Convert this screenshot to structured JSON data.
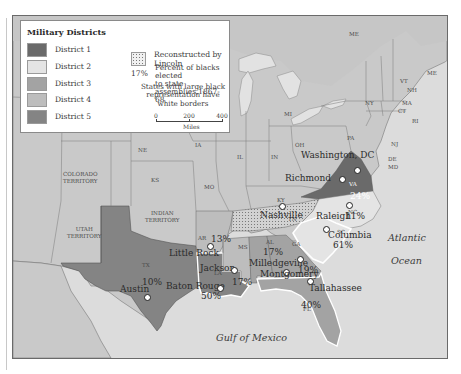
{
  "legend": {
    "title": "Military Districts",
    "districts": [
      {
        "label": "District 1",
        "color": "#6a6a6a"
      },
      {
        "label": "District 2",
        "color": "#e4e4e4"
      },
      {
        "label": "District 3",
        "color": "#a3a3a3"
      },
      {
        "label": "District 4",
        "color": "#bdbdbd"
      },
      {
        "label": "District 5",
        "color": "#848484"
      }
    ],
    "lincoln_label": "Reconstructed by Lincoln",
    "pct_sample": "17%",
    "pct_desc_1": "Percent of blacks elected",
    "pct_desc_2": "to state assemblies,1867-68",
    "white_border_note_1": "States with large black",
    "white_border_note_2": "representation have white borders",
    "scale": {
      "ticks": [
        "0",
        "200",
        "400"
      ],
      "unit": "Miles"
    }
  },
  "colors": {
    "land": "#c9c9c9",
    "water": "#dcdcdc",
    "lakes": "#e2e2e2",
    "tennessee_dotted": "#d2d2d2"
  },
  "states": {
    "ME": "ME",
    "VT": "VT",
    "NH": "NH",
    "MA": "MA",
    "CT": "CT",
    "RI": "RI",
    "NY": "NY",
    "NJ": "NJ",
    "PA": "PA",
    "DE": "DE",
    "MD": "MD",
    "OH": "OH",
    "MI": "MI",
    "IN": "IN",
    "IL": "IL",
    "IA": "IA",
    "MO": "MO",
    "KS": "KS",
    "NE": "NE",
    "KY": "KY",
    "TN": "TN",
    "VA": "VA",
    "NC": "NC",
    "SC": "SC",
    "GA": "GA",
    "AL": "AL",
    "MS": "MS",
    "LA": "LA",
    "AR": "AR",
    "TX": "TX",
    "FL": "FL"
  },
  "territories": {
    "colorado": [
      "COLORADO",
      "TERRITORY"
    ],
    "utah": [
      "UTAH",
      "TERRITORY"
    ],
    "indian": [
      "INDIAN",
      "TERRITORY"
    ]
  },
  "cities": {
    "washington": "Washington, DC",
    "richmond": "Richmond",
    "nashville": "Nashville",
    "raleigh": "Raleigh",
    "columbia": "Columbia",
    "little_rock": "Little Rock",
    "jackson": "Jackson",
    "milledgeville": "Milledgeville",
    "montgomery": "Montgomery",
    "tallahassee": "Tallahassee",
    "baton_rouge": "Baton Rouge",
    "austin": "Austin"
  },
  "percentages": {
    "VA": "24%",
    "NC": "11%",
    "SC": "61%",
    "AR": "13%",
    "AL": "17%",
    "GA": "19%",
    "MS": "17%",
    "LA": "50%",
    "TX": "10%",
    "FL": "40%"
  },
  "water_labels": {
    "atlantic": "Atlantic",
    "ocean": "Ocean",
    "gulf": "Gulf of Mexico"
  }
}
